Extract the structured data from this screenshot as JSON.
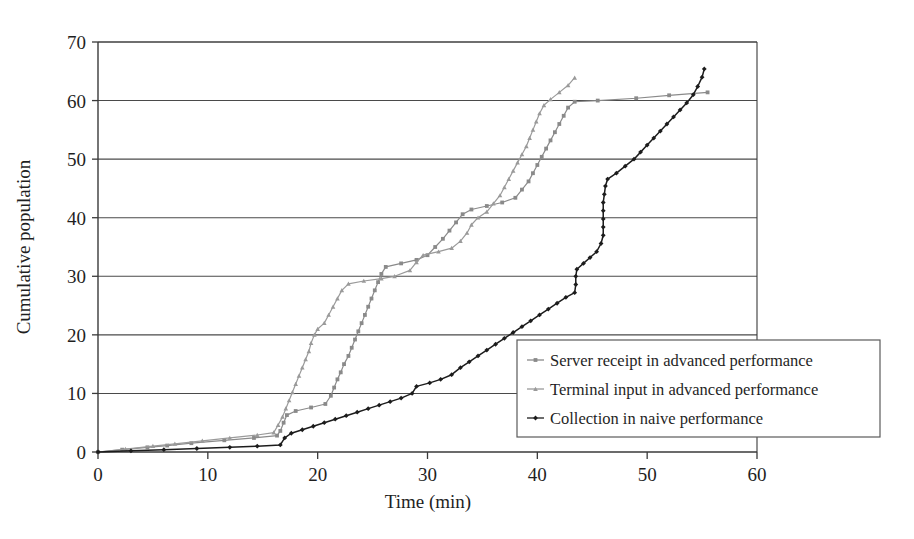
{
  "chart_data": {
    "type": "line",
    "title": "",
    "xlabel": "Time (min)",
    "ylabel": "Cumulative population",
    "xlim": [
      0,
      60
    ],
    "ylim": [
      0,
      70
    ],
    "xticks": [
      0,
      10,
      20,
      30,
      40,
      50,
      60
    ],
    "yticks": [
      0,
      10,
      20,
      30,
      40,
      50,
      60,
      70
    ],
    "grid": "horizontal",
    "legend_position": "inside-right-lower",
    "series": [
      {
        "name": "Server receipt in advanced performance",
        "color": "#8a8a8a",
        "marker": "square",
        "points": [
          [
            0,
            0
          ],
          [
            2.2,
            0.4
          ],
          [
            4.5,
            0.8
          ],
          [
            6.3,
            1.1
          ],
          [
            8.5,
            1.5
          ],
          [
            11.5,
            2.0
          ],
          [
            14.2,
            2.4
          ],
          [
            16.3,
            2.8
          ],
          [
            16.6,
            3.6
          ],
          [
            16.9,
            5.0
          ],
          [
            17.2,
            6.3
          ],
          [
            18.0,
            7.0
          ],
          [
            19.4,
            7.6
          ],
          [
            20.7,
            8.2
          ],
          [
            21.2,
            9.6
          ],
          [
            21.5,
            11.0
          ],
          [
            21.8,
            12.4
          ],
          [
            22.1,
            13.6
          ],
          [
            22.4,
            15.0
          ],
          [
            22.8,
            16.4
          ],
          [
            23.1,
            17.8
          ],
          [
            23.4,
            19.2
          ],
          [
            23.7,
            20.6
          ],
          [
            24.0,
            22.0
          ],
          [
            24.3,
            23.4
          ],
          [
            24.6,
            24.8
          ],
          [
            24.9,
            26.2
          ],
          [
            25.2,
            27.6
          ],
          [
            25.5,
            29.0
          ],
          [
            25.8,
            30.4
          ],
          [
            26.2,
            31.6
          ],
          [
            27.6,
            32.2
          ],
          [
            29.0,
            32.8
          ],
          [
            30.0,
            33.6
          ],
          [
            30.7,
            35.0
          ],
          [
            31.4,
            36.4
          ],
          [
            32.0,
            37.8
          ],
          [
            32.6,
            39.2
          ],
          [
            33.2,
            40.6
          ],
          [
            34.0,
            41.4
          ],
          [
            35.4,
            42.0
          ],
          [
            36.8,
            42.6
          ],
          [
            38.0,
            43.4
          ],
          [
            38.6,
            44.8
          ],
          [
            39.2,
            46.2
          ],
          [
            39.6,
            47.6
          ],
          [
            40.0,
            49.0
          ],
          [
            40.4,
            50.4
          ],
          [
            40.8,
            51.8
          ],
          [
            41.2,
            53.2
          ],
          [
            41.6,
            54.6
          ],
          [
            42.0,
            56.0
          ],
          [
            42.4,
            57.4
          ],
          [
            42.8,
            58.8
          ],
          [
            43.4,
            59.8
          ],
          [
            45.5,
            60.0
          ],
          [
            49.0,
            60.4
          ],
          [
            52.0,
            60.9
          ],
          [
            55.5,
            61.4
          ]
        ]
      },
      {
        "name": "Terminal input in advanced performance",
        "color": "#9a9a9a",
        "marker": "triangle",
        "points": [
          [
            0,
            0
          ],
          [
            2.5,
            0.5
          ],
          [
            5.0,
            1.0
          ],
          [
            7.0,
            1.4
          ],
          [
            9.5,
            1.9
          ],
          [
            12.0,
            2.4
          ],
          [
            14.5,
            2.9
          ],
          [
            16.0,
            3.3
          ],
          [
            16.4,
            4.6
          ],
          [
            16.8,
            6.0
          ],
          [
            17.1,
            7.4
          ],
          [
            17.4,
            8.8
          ],
          [
            17.7,
            10.2
          ],
          [
            18.0,
            11.6
          ],
          [
            18.3,
            13.0
          ],
          [
            18.6,
            14.4
          ],
          [
            18.9,
            15.8
          ],
          [
            19.2,
            17.2
          ],
          [
            19.4,
            18.6
          ],
          [
            19.7,
            20.0
          ],
          [
            20.0,
            21.0
          ],
          [
            20.6,
            22.0
          ],
          [
            21.0,
            23.4
          ],
          [
            21.4,
            24.8
          ],
          [
            21.8,
            26.2
          ],
          [
            22.2,
            27.6
          ],
          [
            22.8,
            28.7
          ],
          [
            24.2,
            29.2
          ],
          [
            25.8,
            29.6
          ],
          [
            27.0,
            30.0
          ],
          [
            28.4,
            31.0
          ],
          [
            29.0,
            32.4
          ],
          [
            29.6,
            33.6
          ],
          [
            31.0,
            34.2
          ],
          [
            32.2,
            34.8
          ],
          [
            33.0,
            36.0
          ],
          [
            33.6,
            37.4
          ],
          [
            34.0,
            38.8
          ],
          [
            34.6,
            40.0
          ],
          [
            35.4,
            41.0
          ],
          [
            36.0,
            42.4
          ],
          [
            36.6,
            43.8
          ],
          [
            37.0,
            45.2
          ],
          [
            37.4,
            46.6
          ],
          [
            37.8,
            48.0
          ],
          [
            38.2,
            49.4
          ],
          [
            38.6,
            50.8
          ],
          [
            39.0,
            52.2
          ],
          [
            39.3,
            53.6
          ],
          [
            39.6,
            55.0
          ],
          [
            39.9,
            56.4
          ],
          [
            40.2,
            57.8
          ],
          [
            40.6,
            59.2
          ],
          [
            41.2,
            60.2
          ],
          [
            42.0,
            61.4
          ],
          [
            42.8,
            62.6
          ],
          [
            43.4,
            63.9
          ]
        ]
      },
      {
        "name": "Collection in naive performance",
        "color": "#1c1c1c",
        "marker": "diamond",
        "points": [
          [
            0,
            0
          ],
          [
            3.0,
            0.2
          ],
          [
            6.0,
            0.4
          ],
          [
            9.0,
            0.6
          ],
          [
            12.0,
            0.8
          ],
          [
            14.5,
            1.0
          ],
          [
            16.6,
            1.2
          ],
          [
            17.0,
            2.4
          ],
          [
            17.6,
            3.2
          ],
          [
            18.6,
            3.8
          ],
          [
            19.6,
            4.4
          ],
          [
            20.6,
            5.0
          ],
          [
            21.6,
            5.6
          ],
          [
            22.6,
            6.2
          ],
          [
            23.6,
            6.8
          ],
          [
            24.6,
            7.4
          ],
          [
            25.6,
            8.0
          ],
          [
            26.6,
            8.6
          ],
          [
            27.6,
            9.2
          ],
          [
            28.6,
            10.0
          ],
          [
            29.0,
            11.2
          ],
          [
            30.2,
            11.8
          ],
          [
            31.2,
            12.4
          ],
          [
            32.2,
            13.2
          ],
          [
            33.0,
            14.4
          ],
          [
            33.8,
            15.4
          ],
          [
            34.6,
            16.4
          ],
          [
            35.4,
            17.4
          ],
          [
            36.2,
            18.4
          ],
          [
            37.0,
            19.4
          ],
          [
            37.8,
            20.4
          ],
          [
            38.6,
            21.4
          ],
          [
            39.4,
            22.4
          ],
          [
            40.2,
            23.4
          ],
          [
            41.0,
            24.4
          ],
          [
            41.8,
            25.4
          ],
          [
            42.6,
            26.4
          ],
          [
            43.4,
            27.2
          ],
          [
            43.5,
            28.6
          ],
          [
            43.5,
            30.0
          ],
          [
            43.6,
            31.2
          ],
          [
            44.2,
            32.2
          ],
          [
            44.8,
            33.2
          ],
          [
            45.4,
            34.2
          ],
          [
            45.8,
            35.6
          ],
          [
            46.0,
            37.0
          ],
          [
            46.0,
            38.4
          ],
          [
            46.0,
            39.8
          ],
          [
            46.0,
            41.2
          ],
          [
            46.0,
            42.6
          ],
          [
            46.1,
            44.0
          ],
          [
            46.2,
            45.4
          ],
          [
            46.4,
            46.6
          ],
          [
            47.2,
            47.6
          ],
          [
            48.0,
            48.8
          ],
          [
            48.8,
            50.0
          ],
          [
            49.4,
            51.2
          ],
          [
            50.0,
            52.4
          ],
          [
            50.6,
            53.6
          ],
          [
            51.2,
            54.8
          ],
          [
            51.8,
            56.0
          ],
          [
            52.4,
            57.2
          ],
          [
            53.0,
            58.4
          ],
          [
            53.6,
            59.6
          ],
          [
            54.2,
            61.0
          ],
          [
            54.6,
            62.4
          ],
          [
            55.0,
            64.0
          ],
          [
            55.2,
            65.4
          ]
        ]
      }
    ]
  },
  "axis": {
    "y_title": "Cumulative population",
    "x_title": "Time (min)",
    "x_tick_labels": [
      "0",
      "10",
      "20",
      "30",
      "40",
      "50",
      "60"
    ],
    "y_tick_labels": [
      "0",
      "10",
      "20",
      "30",
      "40",
      "50",
      "60",
      "70"
    ]
  },
  "legend": {
    "items": [
      {
        "label": "Server receipt in advanced performance",
        "color": "#8a8a8a"
      },
      {
        "label": "Terminal input in advanced performance",
        "color": "#9a9a9a"
      },
      {
        "label": "Collection in naive performance",
        "color": "#1c1c1c"
      }
    ]
  },
  "colors": {
    "axis": "#3a3a3a",
    "grid": "#4a4a4a",
    "background": "#ffffff",
    "legend_border": "#5a5a5a"
  }
}
